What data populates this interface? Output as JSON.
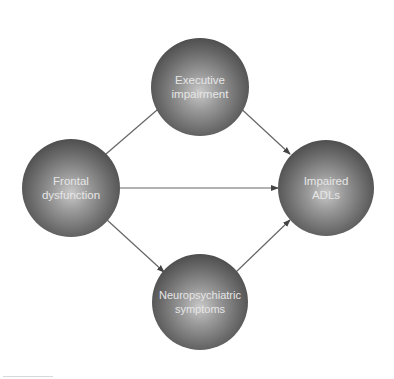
{
  "diagram": {
    "nodes": [
      {
        "id": "frontal",
        "label": "Frontal\ndysfunction"
      },
      {
        "id": "executive",
        "label": "Executive\nimpairment"
      },
      {
        "id": "neuro",
        "label": "Neuropsychiatric\nsymptoms"
      },
      {
        "id": "adls",
        "label": "Impaired\nADLs"
      }
    ],
    "edges": [
      {
        "from": "frontal",
        "to": "executive"
      },
      {
        "from": "frontal",
        "to": "adls"
      },
      {
        "from": "frontal",
        "to": "neuro"
      },
      {
        "from": "executive",
        "to": "adls"
      },
      {
        "from": "neuro",
        "to": "adls"
      }
    ],
    "colors": {
      "node_dark": "#2e2e2e",
      "node_light": "#c9c9c9",
      "label": "#e6e6e6",
      "edge": "#555555"
    }
  }
}
